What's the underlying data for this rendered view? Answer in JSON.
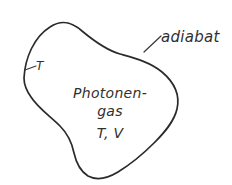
{
  "figure": {
    "type": "thermodynamic-schematic-diagram",
    "background_color": "#ffffff",
    "stroke_color": "#2b2b2b",
    "text_color": "#303030",
    "boundary": {
      "name": "adiabatic-boundary",
      "label": "adiabat",
      "shape": "closed irregular blob"
    },
    "callouts": {
      "adiabat_label": "adiabat",
      "temperature_label": "T"
    },
    "interior": {
      "line1": "Photonen-",
      "line2": "gas",
      "line3": "T, V"
    }
  }
}
